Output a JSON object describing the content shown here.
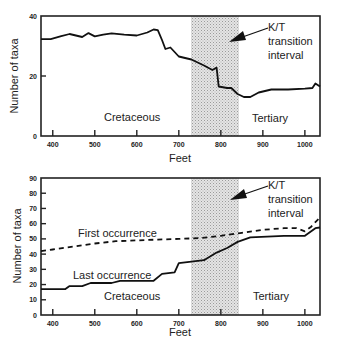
{
  "chart_data": [
    {
      "type": "line",
      "title": "",
      "xlabel": "Feet",
      "ylabel": "Number of taxa",
      "xlim": [
        372,
        1036
      ],
      "ylim": [
        0,
        40
      ],
      "x_ticks": [
        400,
        500,
        600,
        700,
        800,
        900,
        1000
      ],
      "y_ticks": [
        0,
        20,
        40
      ],
      "grid": false,
      "shaded_interval": {
        "from": 725,
        "to": 838,
        "label": "K/T transition interval"
      },
      "annotations": [
        "Cretaceous",
        "Tertiary",
        "K/T",
        "transition",
        "interval"
      ],
      "series": [
        {
          "name": "Number of taxa",
          "style": "solid",
          "x": [
            372,
            395,
            420,
            440,
            455,
            470,
            485,
            500,
            520,
            540,
            570,
            600,
            625,
            640,
            650,
            660,
            668,
            680,
            690,
            700,
            730,
            760,
            780,
            790,
            795,
            815,
            825,
            840,
            855,
            870,
            890,
            920,
            960,
            1000,
            1018,
            1025,
            1036
          ],
          "values": [
            32.3,
            32.3,
            33.3,
            34,
            33.5,
            33,
            34.3,
            33.2,
            33.8,
            34.2,
            33.8,
            33.5,
            34.5,
            35.5,
            35.3,
            32,
            29,
            29.5,
            28,
            26.5,
            25.5,
            23.5,
            22,
            22.8,
            16.5,
            16,
            16,
            14,
            13,
            13,
            14.5,
            15.5,
            15.5,
            15.8,
            16,
            17.5,
            16.5
          ]
        }
      ]
    },
    {
      "type": "line",
      "title": "",
      "xlabel": "Feet",
      "ylabel": "Number of taxa",
      "xlim": [
        372,
        1036
      ],
      "ylim": [
        0,
        90
      ],
      "x_ticks": [
        400,
        500,
        600,
        700,
        800,
        900,
        1000
      ],
      "y_ticks": [
        0,
        10,
        20,
        30,
        40,
        50,
        60,
        70,
        80,
        90
      ],
      "grid": false,
      "shaded_interval": {
        "from": 725,
        "to": 838,
        "label": "K/T transition interval"
      },
      "annotations": [
        "First occurrence",
        "Last occurrence",
        "Cretaceous",
        "Tertiary",
        "K/T",
        "transition",
        "interval"
      ],
      "series": [
        {
          "name": "First occurrence",
          "style": "dashed",
          "x": [
            372,
            400,
            450,
            500,
            550,
            600,
            650,
            700,
            750,
            800,
            850,
            900,
            950,
            980,
            1000,
            1015,
            1025,
            1036
          ],
          "values": [
            42,
            43,
            45,
            47,
            48.5,
            49,
            49.5,
            50,
            50.5,
            52,
            54,
            56,
            57,
            57,
            55,
            58,
            61,
            64
          ]
        },
        {
          "name": "Last occurrence",
          "style": "solid",
          "x": [
            372,
            430,
            440,
            470,
            490,
            540,
            560,
            640,
            660,
            690,
            700,
            760,
            790,
            815,
            840,
            870,
            950,
            1000,
            1025,
            1036
          ],
          "values": [
            17,
            17,
            19,
            19,
            21,
            21,
            22.5,
            22.5,
            27,
            28,
            34,
            36,
            41,
            44,
            48,
            51,
            52,
            52,
            57,
            57.5
          ]
        }
      ]
    }
  ],
  "top_chart": {
    "ylabel": "Number of taxa",
    "xlabel": "Feet",
    "y_ticks": [
      "0",
      "20",
      "40"
    ],
    "x_ticks": [
      "400",
      "500",
      "600",
      "700",
      "800",
      "900",
      "1000"
    ],
    "label_left": "Cretaceous",
    "label_right": "Tertiary",
    "callout": [
      "K/T",
      "transition",
      "interval"
    ]
  },
  "bottom_chart": {
    "ylabel": "Number of taxa",
    "xlabel": "Feet",
    "y_ticks": [
      "0",
      "10",
      "20",
      "30",
      "40",
      "50",
      "60",
      "70",
      "80",
      "90"
    ],
    "x_ticks": [
      "400",
      "500",
      "600",
      "700",
      "800",
      "900",
      "1000"
    ],
    "label_first": "First occurrence",
    "label_last": "Last occurrence",
    "label_left": "Cretaceous",
    "label_right": "Tertiary",
    "callout": [
      "K/T",
      "transition",
      "interval"
    ]
  },
  "colors": {
    "ink": "#222222",
    "shade": "#d0d0d0"
  }
}
